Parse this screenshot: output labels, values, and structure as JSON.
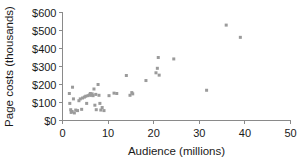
{
  "chart_data": {
    "type": "scatter",
    "title": "",
    "xlabel": "Audience (millions)",
    "ylabel": "Page costs (thousands)",
    "xlim": [
      0,
      50
    ],
    "ylim": [
      0,
      600
    ],
    "xticks": [
      0,
      10,
      20,
      30,
      40,
      50
    ],
    "yticks": [
      0,
      100,
      200,
      300,
      400,
      500,
      600
    ],
    "xticklabels": [
      "0",
      "10",
      "20",
      "30",
      "40",
      "50"
    ],
    "yticklabels": [
      "$0",
      "$100",
      "$200",
      "$300",
      "$400",
      "$500",
      "$600"
    ],
    "grid": false,
    "legend": null,
    "marker": "square",
    "marker_color": "#9b9b9b",
    "marker_size": 3,
    "points": [
      [
        1.5,
        150
      ],
      [
        1.6,
        95
      ],
      [
        1.8,
        60
      ],
      [
        1.9,
        45
      ],
      [
        2.1,
        50
      ],
      [
        2.2,
        185
      ],
      [
        2.4,
        120
      ],
      [
        2.6,
        42
      ],
      [
        2.9,
        58
      ],
      [
        3.3,
        55
      ],
      [
        3.6,
        110
      ],
      [
        3.9,
        120
      ],
      [
        4.2,
        62
      ],
      [
        4.4,
        125
      ],
      [
        4.8,
        130
      ],
      [
        5.1,
        135
      ],
      [
        5.3,
        95
      ],
      [
        5.6,
        138
      ],
      [
        5.9,
        142
      ],
      [
        6.1,
        150
      ],
      [
        6.3,
        140
      ],
      [
        6.5,
        148
      ],
      [
        6.7,
        138
      ],
      [
        6.9,
        175
      ],
      [
        7.1,
        85
      ],
      [
        7.3,
        145
      ],
      [
        7.4,
        60
      ],
      [
        7.8,
        200
      ],
      [
        8.0,
        140
      ],
      [
        8.2,
        95
      ],
      [
        8.4,
        58
      ],
      [
        8.7,
        72
      ],
      [
        9.1,
        55
      ],
      [
        10.2,
        138
      ],
      [
        11.3,
        152
      ],
      [
        11.9,
        150
      ],
      [
        14.0,
        250
      ],
      [
        14.8,
        140
      ],
      [
        15.2,
        155
      ],
      [
        15.4,
        148
      ],
      [
        18.3,
        222
      ],
      [
        20.5,
        265
      ],
      [
        20.8,
        290
      ],
      [
        21.0,
        350
      ],
      [
        21.2,
        252
      ],
      [
        24.4,
        342
      ],
      [
        31.6,
        168
      ],
      [
        35.9,
        530
      ],
      [
        39.0,
        462
      ]
    ]
  }
}
